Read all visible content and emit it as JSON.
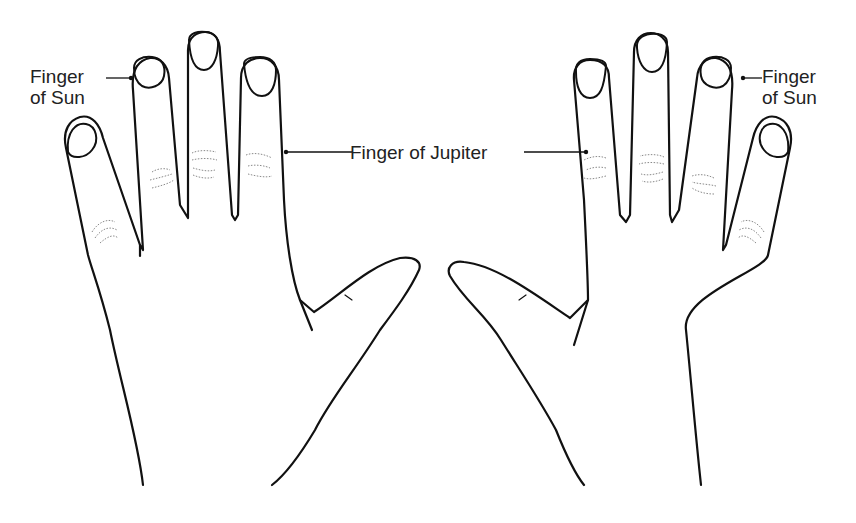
{
  "diagram": {
    "type": "anatomical-illustration",
    "colors": {
      "background": "#ffffff",
      "line": "#111111",
      "text": "#222222",
      "crease": "#8a8a8a"
    },
    "labels": {
      "sun_left_line1": "Finger",
      "sun_left_line2": "of Sun",
      "sun_right_line1": "Finger",
      "sun_right_line2": "of Sun",
      "jupiter": "Finger of Jupiter"
    },
    "annotations": [
      {
        "text": "Finger of Sun",
        "points_to": "left hand ring finger"
      },
      {
        "text": "Finger of Sun",
        "points_to": "right hand ring finger"
      },
      {
        "text": "Finger of Jupiter",
        "points_to": "index fingers of both hands"
      }
    ]
  }
}
